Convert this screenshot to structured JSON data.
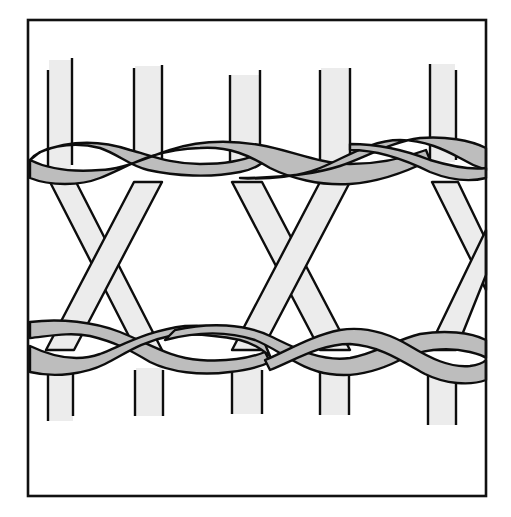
{
  "figure": {
    "title": "",
    "colors": {
      "background": "#ffffff",
      "frame": "#111111",
      "outline": "#0d0d0d",
      "stake_fill": "#ececec",
      "weaver_fill": "#bdbdbd"
    },
    "frame": {
      "x": 28,
      "y": 20,
      "w": 458,
      "h": 476
    },
    "top_stakes": [
      {
        "x1": 48,
        "x2": 72,
        "top": 60
      },
      {
        "x1": 134,
        "x2": 162,
        "top": 66
      },
      {
        "x1": 230,
        "x2": 260,
        "top": 75
      },
      {
        "x1": 320,
        "x2": 350,
        "top": 68
      },
      {
        "x1": 430,
        "x2": 456,
        "top": 64
      }
    ],
    "bottom_stakes": [
      {
        "x1": 48,
        "x2": 73,
        "bottom": 421
      },
      {
        "x1": 135,
        "x2": 163,
        "bottom": 416
      },
      {
        "x1": 232,
        "x2": 262,
        "bottom": 414
      },
      {
        "x1": 320,
        "x2": 349,
        "bottom": 415
      },
      {
        "x1": 428,
        "x2": 456,
        "bottom": 425
      }
    ],
    "twining_rows": [
      {
        "name": "top-row",
        "y": 162
      },
      {
        "name": "bottom-row",
        "y": 350
      }
    ]
  }
}
